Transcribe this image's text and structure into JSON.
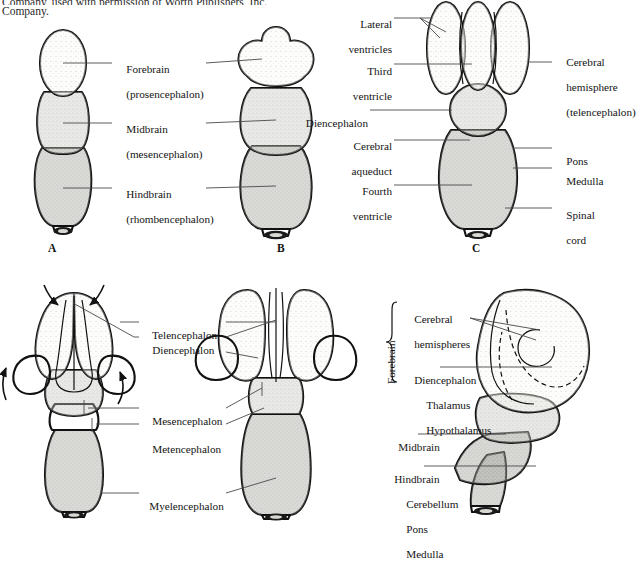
{
  "figure": {
    "type": "anatomical-diagram",
    "caption_top_clipped": "Company, used with permission of Worth Publishers, Inc.",
    "caption_top_line2": "Company."
  },
  "colors": {
    "forebrain": "#fbfbf7",
    "midbrain": "#c9c9c3",
    "hindbrain": "#a2a29c",
    "outline": "#111111",
    "leader_line": "#4a4a4a",
    "text": "#141414",
    "background": "#ffffff"
  },
  "panels": [
    {
      "id": "A",
      "letter": "A",
      "name": "three-vesicle-stage-dorsal",
      "labels": [
        {
          "name": "forebrain",
          "line1": "Forebrain",
          "line2": "(prosencephalon)"
        },
        {
          "name": "midbrain",
          "line1": "Midbrain",
          "line2": "(mesencephalon)"
        },
        {
          "name": "hindbrain",
          "line1": "Hindbrain",
          "line2": "(rhombencephalon)"
        }
      ]
    },
    {
      "id": "B",
      "letter": "B",
      "name": "three-vesicle-stage-expanded",
      "labels": []
    },
    {
      "id": "C",
      "letter": "C",
      "name": "ventricular-system-dorsal",
      "labels": [
        {
          "name": "lateral-ventricles",
          "line1": "Lateral",
          "line2": "ventricles"
        },
        {
          "name": "third-ventricle",
          "line1": "Third",
          "line2": "ventricle"
        },
        {
          "name": "diencephalon",
          "line1": "Diencephalon",
          "line2": ""
        },
        {
          "name": "cerebral-aqueduct",
          "line1": "Cerebral",
          "line2": "aqueduct"
        },
        {
          "name": "fourth-ventricle",
          "line1": "Fourth",
          "line2": "ventricle"
        },
        {
          "name": "cerebral-hemisphere",
          "line1": "Cerebral",
          "line2": "hemisphere",
          "line3": "(telencephalon)"
        },
        {
          "name": "pons",
          "line1": "Pons",
          "line2": ""
        },
        {
          "name": "medulla",
          "line1": "Medulla",
          "line2": ""
        },
        {
          "name": "spinal-cord",
          "line1": "Spinal",
          "line2": "cord"
        }
      ]
    },
    {
      "id": "D",
      "letter": "",
      "name": "five-vesicle-stage-early",
      "labels": [
        {
          "name": "telencephalon",
          "line1": "Telencephalon",
          "line2": ""
        },
        {
          "name": "diencephalon",
          "line1": "Diencephalon",
          "line2": ""
        },
        {
          "name": "mesencephalon",
          "line1": "Mesencephalon",
          "line2": ""
        },
        {
          "name": "metencephalon",
          "line1": "Metencephalon",
          "line2": ""
        },
        {
          "name": "myelencephalon",
          "line1": "Myelencephalon",
          "line2": ""
        }
      ]
    },
    {
      "id": "E",
      "letter": "",
      "name": "mature-brain-lateral",
      "bracket_label": "Forebrain",
      "labels": [
        {
          "name": "cerebral-hemispheres",
          "line1": "Cerebral",
          "line2": "hemispheres"
        },
        {
          "name": "diencephalon-group",
          "line1": "Diencephalon",
          "line2": "Thalamus",
          "line3": "Hypothalamus"
        },
        {
          "name": "midbrain",
          "line1": "Midbrain",
          "line2": ""
        },
        {
          "name": "hindbrain-group",
          "line1": "Hindbrain",
          "line2": "Cerebellum",
          "line3": "Pons",
          "line4": "Medulla"
        }
      ]
    }
  ]
}
